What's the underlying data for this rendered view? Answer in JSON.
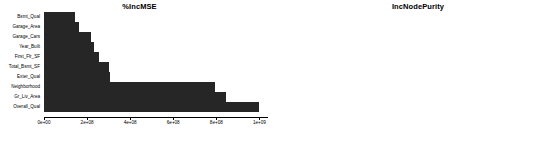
{
  "figure": {
    "background_color": "#ffffff",
    "bar_color": "#262626",
    "axis_color": "#000000",
    "width": 557,
    "height": 144
  },
  "chart_data": [
    {
      "type": "bar",
      "orientation": "horizontal",
      "title": "%IncMSE",
      "xlabel": "",
      "ylabel": "",
      "xlim": [
        0,
        1040000000
      ],
      "grid": false,
      "legend": null,
      "axis_ticks": [
        {
          "value": 0,
          "label": "0e+00"
        },
        {
          "value": 200000000,
          "label": "2e+08"
        },
        {
          "value": 400000000,
          "label": "4e+08"
        },
        {
          "value": 600000000,
          "label": "6e+08"
        },
        {
          "value": 800000000,
          "label": "8e+08"
        },
        {
          "value": 1000000000,
          "label": "1e+09"
        }
      ],
      "categories": [
        "Bsmt_Qual",
        "Garage_Area",
        "Garage_Cars",
        "Year_Built",
        "First_Flr_SF",
        "Total_Bsmt_SF",
        "Exter_Qual",
        "Neighborhood",
        "Gr_Liv_Area",
        "Overall_Qual"
      ],
      "values": [
        145000000,
        163000000,
        218000000,
        232000000,
        254000000,
        300000000,
        305000000,
        795000000,
        845000000,
        1000000000
      ]
    },
    {
      "type": "bar",
      "orientation": "horizontal",
      "title": "IncNodePurity",
      "xlabel": "",
      "ylabel": "",
      "xlim": [
        0,
        4400000000000
      ],
      "grid": false,
      "legend": null,
      "axis_ticks": [
        {
          "value": 0,
          "label": "0e+00"
        },
        {
          "value": 1000000000000,
          "label": "1e+12"
        },
        {
          "value": 2000000000000,
          "label": "2e+12"
        },
        {
          "value": 3000000000000,
          "label": "3e+12"
        },
        {
          "value": 4000000000000,
          "label": "4e+12"
        }
      ],
      "categories": [
        "Garage_Area",
        "Year_Built",
        "First_Flr_SF",
        "Bsmt_Qual",
        "Total_Bsmt_SF",
        "Garage_Cars",
        "Gr_Liv_Area",
        "Exter_Qual",
        "Neighborhood",
        "Overall_Qual"
      ],
      "values": [
        580000000000,
        640000000000,
        730000000000,
        750000000000,
        830000000000,
        1370000000000,
        1580000000000,
        1670000000000,
        2400000000000,
        4270000000000
      ]
    }
  ]
}
